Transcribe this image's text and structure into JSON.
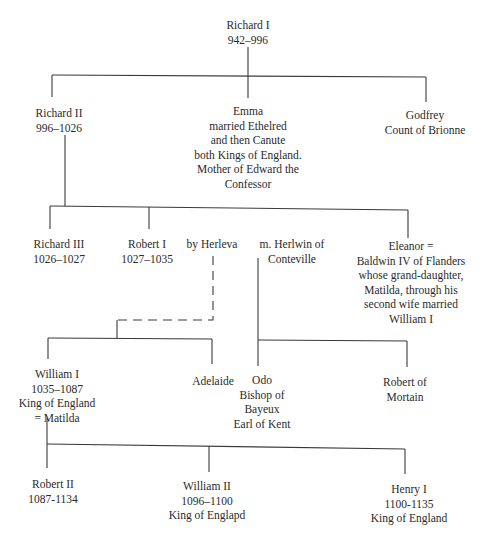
{
  "colors": {
    "background": "#ffffff",
    "ink": "#2a2a2a"
  },
  "nodes": {
    "richard_i": {
      "lines": [
        "Richard I",
        "942–996"
      ]
    },
    "richard_ii": {
      "lines": [
        "Richard II",
        "996–1026"
      ]
    },
    "emma": {
      "lines": [
        "Emma",
        "married Ethelred",
        "and then Canute",
        "both Kings of England.",
        "Mother of Edward the",
        "Confessor"
      ]
    },
    "godfrey": {
      "lines": [
        "Godfrey",
        "Count of Brionne"
      ]
    },
    "richard_iii": {
      "lines": [
        "Richard III",
        "1026–1027"
      ]
    },
    "robert_i": {
      "lines": [
        "Robert I",
        "1027–1035"
      ]
    },
    "herleva": {
      "lines": [
        "by Herleva"
      ]
    },
    "herlwin": {
      "lines": [
        "m. Herlwin of",
        "Conteville"
      ]
    },
    "eleanor": {
      "lines": [
        "Eleanor =",
        "Baldwin IV of Flanders",
        "whose grand-daughter,",
        "Matilda, through his",
        "second wife married",
        "William I"
      ]
    },
    "william_i": {
      "lines": [
        "William I",
        "1035–1087",
        "King of England",
        "= Matilda"
      ]
    },
    "adelaide": {
      "lines": [
        "Adelaide"
      ]
    },
    "odo": {
      "lines": [
        "Odo",
        "Bishop of",
        "Bayeux",
        "Earl of Kent"
      ]
    },
    "robert_mortain": {
      "lines": [
        "Robert of",
        "Mortain"
      ]
    },
    "robert_ii": {
      "lines": [
        "Robert II",
        "1087-1134"
      ]
    },
    "william_ii": {
      "lines": [
        "William II",
        "1096–1100",
        "King of Englapd"
      ]
    },
    "henry_i": {
      "lines": [
        "Henry I",
        "1100-1135",
        "King of England"
      ]
    }
  }
}
